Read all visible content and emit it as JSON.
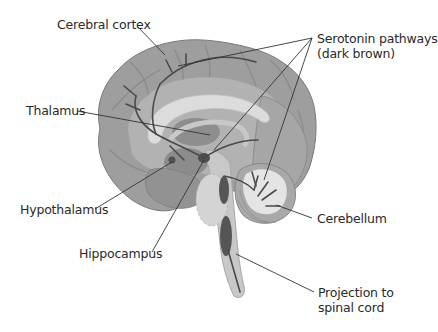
{
  "diagram": {
    "labels": {
      "cerebral_cortex": "Cerebral cortex",
      "serotonin_line1": "Serotonin pathways",
      "serotonin_line2": "(dark brown)",
      "thalamus": "Thalamus",
      "hypothalamus": "Hypothalamus",
      "hippocampus": "Hippocampus",
      "cerebellum": "Cerebellum",
      "projection_line1": "Projection to",
      "projection_line2": "spinal cord"
    },
    "colors": {
      "background": "#ffffff",
      "cortex_outer": "#9e9e9e",
      "cortex_inner": "#b4b4b4",
      "corpus_callosum": "#dcdcdc",
      "pathway": "#4a4a4a",
      "nucleus": "#555555",
      "brainstem": "#c8c8c8",
      "cerebellum": "#a8a8a8",
      "cerebellum_core": "#e6e6e6",
      "leader_line": "#333333",
      "text": "#2a2a2a"
    }
  }
}
